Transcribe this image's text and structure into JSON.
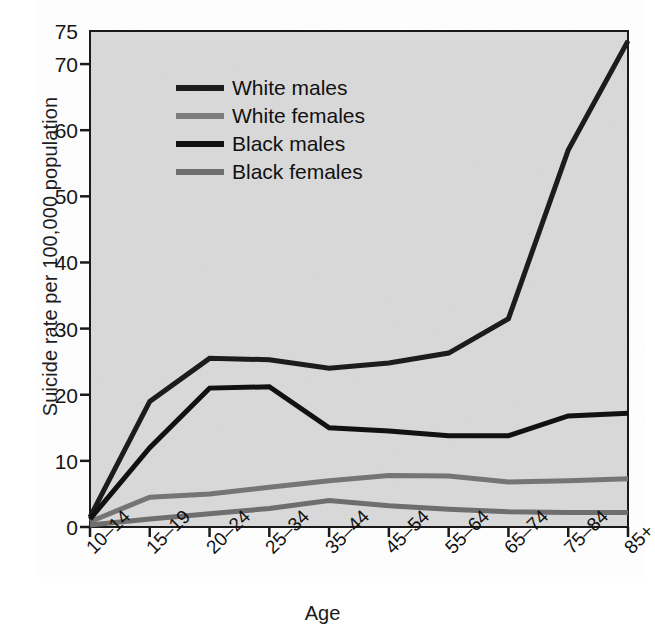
{
  "chart_data": {
    "type": "line",
    "title": "",
    "xlabel": "Age",
    "ylabel": "Suicide rate per 100,000 population",
    "categories": [
      "10–14",
      "15–19",
      "20–24",
      "25–34",
      "35–44",
      "45–54",
      "55–64",
      "65–74",
      "75–84",
      "85+"
    ],
    "ylim": [
      0,
      75
    ],
    "yticks": [
      0,
      10,
      20,
      30,
      40,
      50,
      60,
      70,
      75
    ],
    "ytick_labels": [
      "0",
      "10",
      "20",
      "30",
      "40",
      "50",
      "60",
      "70",
      "75"
    ],
    "grid": false,
    "legend_position": "upper left inside",
    "plot_background": "#d9d9d9",
    "series": [
      {
        "name": "White males",
        "color": "#1c1c1c",
        "width": 5,
        "values": [
          1.5,
          19.0,
          25.5,
          25.3,
          24.0,
          24.8,
          26.3,
          31.5,
          57.0,
          73.5
        ]
      },
      {
        "name": "White females",
        "color": "#757575",
        "width": 5,
        "values": [
          0.8,
          4.5,
          5.0,
          6.0,
          7.0,
          7.8,
          7.7,
          6.8,
          7.0,
          7.3
        ]
      },
      {
        "name": "Black males",
        "color": "#111111",
        "width": 5,
        "values": [
          1.2,
          12.0,
          21.0,
          21.2,
          15.0,
          14.5,
          13.8,
          13.8,
          16.8,
          17.2
        ]
      },
      {
        "name": "Black females",
        "color": "#6e6e6e",
        "width": 5,
        "values": [
          0.3,
          1.2,
          2.0,
          2.8,
          4.0,
          3.2,
          2.7,
          2.3,
          2.2,
          2.2
        ]
      }
    ]
  },
  "legend": {
    "items": [
      {
        "label": "White males",
        "color": "#1c1c1c"
      },
      {
        "label": "White females",
        "color": "#7d7d7d"
      },
      {
        "label": "Black males",
        "color": "#111111"
      },
      {
        "label": "Black females",
        "color": "#6e6e6e"
      }
    ]
  },
  "axes": {
    "x_title": "Age",
    "y_title": "Suicide rate per 100,000 population"
  },
  "geometry": {
    "plot_left": 90,
    "plot_right": 628,
    "plot_top": 31,
    "plot_bottom": 527
  }
}
